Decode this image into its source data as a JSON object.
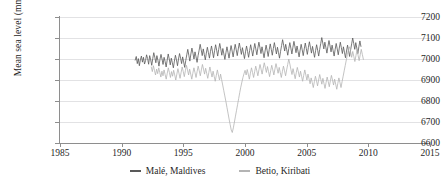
{
  "chart_data": {
    "type": "line",
    "title": "",
    "xlabel": "",
    "ylabel": "Mean sea level (mm)",
    "xlim": [
      1985,
      2015
    ],
    "ylim": [
      6600,
      7200
    ],
    "grid": true,
    "legend_position": "bottom",
    "x_ticks": [
      "1985",
      "1990",
      "1995",
      "2000",
      "2005",
      "2010",
      "2015"
    ],
    "x_tick_values": [
      1985,
      1990,
      1995,
      2000,
      2005,
      2010,
      2015
    ],
    "y_ticks": [
      "6600",
      "6700",
      "6800",
      "6900",
      "7000",
      "7100",
      "7200"
    ],
    "y_tick_values": [
      6600,
      6700,
      6800,
      6900,
      7000,
      7100,
      7200
    ],
    "series": [
      {
        "name": "Malé, Maldives",
        "color": "#595959",
        "x_start": 1991.1,
        "x_end": 2009.4,
        "values": [
          6995,
          7012,
          6978,
          7002,
          6968,
          6996,
          7014,
          6985,
          7008,
          6976,
          6992,
          7020,
          7002,
          6975,
          7016,
          6996,
          6970,
          7002,
          7030,
          7008,
          6982,
          7016,
          6994,
          6966,
          6998,
          7022,
          7000,
          6974,
          7008,
          6988,
          6962,
          6995,
          7024,
          7000,
          6972,
          7004,
          6982,
          6958,
          6990,
          7018,
          6996,
          6968,
          7000,
          7026,
          7004,
          6978,
          7010,
          6986,
          6960,
          6992,
          7020,
          7046,
          7018,
          6990,
          7024,
          7052,
          7028,
          7000,
          7034,
          7010,
          6984,
          7016,
          7042,
          7070,
          7044,
          7016,
          7048,
          7022,
          6996,
          7028,
          7056,
          7030,
          7004,
          7036,
          7062,
          7034,
          7006,
          7040,
          7068,
          7042,
          7014,
          7046,
          7074,
          7048,
          7018,
          7050,
          7024,
          6998,
          7030,
          7058,
          7032,
          7004,
          7036,
          7064,
          7038,
          7010,
          7042,
          7070,
          7044,
          7016,
          7048,
          7076,
          7050,
          7022,
          7054,
          7028,
          7002,
          7034,
          7062,
          7036,
          7008,
          7040,
          7068,
          7042,
          7014,
          7046,
          7074,
          7048,
          7020,
          7052,
          7080,
          7054,
          7026,
          7058,
          7032,
          7006,
          7038,
          7066,
          7040,
          7012,
          7044,
          7072,
          7046,
          7018,
          7050,
          7078,
          7052,
          7024,
          7056,
          7030,
          7004,
          7036,
          7064,
          7092,
          7066,
          7038,
          7070,
          7044,
          7018,
          7050,
          7078,
          7052,
          7024,
          7056,
          7084,
          7058,
          7030,
          7062,
          7036,
          7010,
          7042,
          7070,
          7044,
          7016,
          7048,
          7076,
          7050,
          7022,
          7054,
          7082,
          7056,
          7028,
          7060,
          7034,
          7008,
          7040,
          7068,
          7042,
          7014,
          7046,
          7074,
          7102,
          7076,
          7048,
          7080,
          7054,
          7028,
          7060,
          7088,
          7062,
          7034,
          7066,
          7040,
          7014,
          7046,
          7074,
          7048,
          7020,
          7052,
          7080,
          7054,
          7026,
          7058,
          7032,
          7006,
          7038,
          7066,
          7040,
          7012,
          7044,
          7072,
          7100,
          7074,
          7046,
          7078,
          7052,
          7026,
          7058,
          7086,
          7060
        ]
      },
      {
        "name": "Betio, Kiribati",
        "color": "#b4b4b4",
        "x_start": 1992.4,
        "x_end": 2009.6,
        "values": [
          6962,
          6940,
          6968,
          6946,
          6924,
          6952,
          6930,
          6958,
          6936,
          6914,
          6942,
          6920,
          6948,
          6926,
          6904,
          6932,
          6958,
          6936,
          6912,
          6940,
          6918,
          6946,
          6924,
          6900,
          6928,
          6954,
          6932,
          6908,
          6936,
          6962,
          6940,
          6916,
          6944,
          6970,
          6948,
          6924,
          6952,
          6928,
          6904,
          6932,
          6958,
          6936,
          6912,
          6940,
          6966,
          6944,
          6920,
          6948,
          6974,
          6952,
          6928,
          6956,
          6932,
          6908,
          6936,
          6962,
          6938,
          6914,
          6942,
          6918,
          6894,
          6922,
          6948,
          6924,
          6900,
          6928,
          6902,
          6876,
          6850,
          6824,
          6798,
          6770,
          6742,
          6714,
          6688,
          6662,
          6650,
          6672,
          6700,
          6728,
          6756,
          6784,
          6812,
          6840,
          6866,
          6890,
          6912,
          6930,
          6946,
          6924,
          6950,
          6928,
          6904,
          6932,
          6958,
          6936,
          6912,
          6940,
          6966,
          6944,
          6920,
          6948,
          6974,
          6952,
          6928,
          6956,
          6982,
          6960,
          6936,
          6964,
          6940,
          6916,
          6944,
          6970,
          6948,
          6924,
          6952,
          6978,
          6956,
          6932,
          6960,
          6936,
          6912,
          6940,
          6966,
          6944,
          6920,
          6948,
          6974,
          7000,
          6976,
          6950,
          6926,
          6954,
          6930,
          6906,
          6934,
          6960,
          6938,
          6914,
          6942,
          6918,
          6894,
          6922,
          6948,
          6924,
          6900,
          6928,
          6906,
          6882,
          6910,
          6888,
          6864,
          6892,
          6918,
          6896,
          6872,
          6900,
          6926,
          6904,
          6880,
          6908,
          6884,
          6860,
          6888,
          6914,
          6892,
          6868,
          6896,
          6922,
          6900,
          6876,
          6904,
          6880,
          6856,
          6884,
          6910,
          6888,
          6864,
          6892,
          6918,
          6944,
          6970,
          6996,
          7022,
          7048,
          7058,
          7034,
          7008,
          7036,
          7012,
          6988,
          7016,
          7042,
          7018,
          6992,
          7020,
          7046,
          7022,
          6998
        ]
      }
    ]
  },
  "legend": {
    "items": [
      {
        "label": "Malé, Maldives",
        "color": "#595959"
      },
      {
        "label": "Betio, Kiribati",
        "color": "#b4b4b4"
      }
    ]
  }
}
